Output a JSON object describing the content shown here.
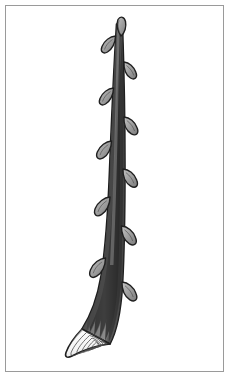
{
  "figure": {
    "title": "Woody twig with alternate buds and cut base",
    "subject": "twig",
    "caption": "",
    "background_color": "#ffffff",
    "frame": {
      "visible": true,
      "color": "#9a9a9a",
      "width_px": 1,
      "inset_px": 5
    },
    "palette": {
      "stem_fill": "#6e6e6e",
      "stem_shadow": "#565656",
      "stem_highlight": "#8c8c8c",
      "bud_fill": "#9e9e9e",
      "bud_highlight": "#bdbdbd",
      "outline": "#1f1f1f",
      "cut_face_fill": "#ffffff",
      "ring_line": "#4a4a4a",
      "hatch_line": "#3d3d3d"
    },
    "stem": {
      "label": "main-stem",
      "tip_point": [
        118,
        24
      ],
      "base_point": [
        100,
        332
      ],
      "tip_width_px": 7,
      "base_width_px": 24,
      "curve": "straight above, bending left-down near base"
    },
    "buds": [
      {
        "label": "terminal-bud",
        "side": "top",
        "x": 119,
        "y": 27,
        "length": 18,
        "width": 9,
        "angle_deg": -18
      },
      {
        "label": "lateral-bud-1",
        "side": "left",
        "x": 108,
        "y": 40,
        "length": 19,
        "width": 9,
        "angle_deg": 28
      },
      {
        "label": "lateral-bud-2",
        "side": "right",
        "x": 127,
        "y": 68,
        "length": 19,
        "width": 9,
        "angle_deg": -22
      },
      {
        "label": "lateral-bud-3",
        "side": "left",
        "x": 107,
        "y": 93,
        "length": 19,
        "width": 9,
        "angle_deg": 26
      },
      {
        "label": "lateral-bud-4",
        "side": "right",
        "x": 125,
        "y": 123,
        "length": 20,
        "width": 10,
        "angle_deg": -24
      },
      {
        "label": "lateral-bud-5",
        "side": "left",
        "x": 105,
        "y": 146,
        "length": 20,
        "width": 10,
        "angle_deg": 25
      },
      {
        "label": "lateral-bud-6",
        "side": "right",
        "x": 124,
        "y": 175,
        "length": 20,
        "width": 10,
        "angle_deg": -24
      },
      {
        "label": "lateral-bud-7",
        "side": "left",
        "x": 103,
        "y": 203,
        "length": 21,
        "width": 11,
        "angle_deg": 26
      },
      {
        "label": "lateral-bud-8",
        "side": "right",
        "x": 121,
        "y": 232,
        "length": 21,
        "width": 11,
        "angle_deg": -25
      },
      {
        "label": "lateral-bud-9",
        "side": "left",
        "x": 100,
        "y": 264,
        "length": 21,
        "width": 11,
        "angle_deg": 27
      },
      {
        "label": "lateral-bud-10",
        "side": "right",
        "x": 123,
        "y": 288,
        "length": 21,
        "width": 11,
        "angle_deg": -26
      }
    ],
    "cut_base": {
      "label": "angled-cut-face",
      "center": [
        96,
        342
      ],
      "major_axis_px": 56,
      "minor_axis_px": 24,
      "angle_deg": 24,
      "ring_count": 5,
      "description": "oblique cut exposing concentric annual growth rings"
    },
    "texture": {
      "hatching": "fine vertical strokes along stem",
      "stroke_count": 26
    }
  }
}
